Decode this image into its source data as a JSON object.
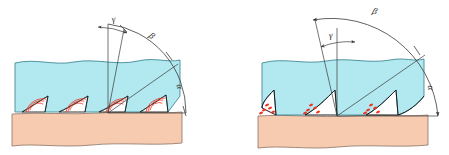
{
  "figure": {
    "background_color": "#ffffff",
    "colors": {
      "chip": "#b2e8ef",
      "chip_stroke": "#2e7d8a",
      "workpiece": "#f7cbb0",
      "workpiece_stroke": "#8a7264",
      "tooth_stroke": "#1a1a1a",
      "friction_mark": "#ee3322",
      "line": "#3a3a3a",
      "label": "#2b2b2b"
    }
  },
  "diagrams": [
    {
      "id": "left",
      "name": "positive-rake-diagram",
      "rake_sign": "positive",
      "friction_mark_style": "arcs",
      "tooth_count": 4,
      "labels": {
        "gamma": "γ",
        "beta": "β",
        "alpha": "α"
      },
      "angle_names": {
        "gamma": "rake-angle",
        "beta": "wedge-angle",
        "alpha": "clearance-angle"
      }
    },
    {
      "id": "right",
      "name": "negative-rake-diagram",
      "rake_sign": "negative",
      "friction_mark_style": "dots",
      "tooth_count": 3,
      "labels": {
        "gamma": "γ",
        "beta": "β",
        "alpha": "α"
      },
      "angle_names": {
        "gamma": "rake-angle",
        "beta": "wedge-angle",
        "alpha": "clearance-angle"
      }
    }
  ]
}
